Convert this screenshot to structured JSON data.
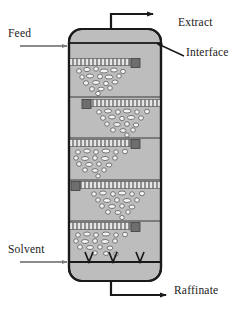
{
  "diagram": {
    "labels": {
      "feed": "Feed",
      "extract": "Extract",
      "interface": "Interface",
      "solvent": "Solvent",
      "raffinate": "Raffinate"
    },
    "colors": {
      "vessel_fill": "#bdbdbd",
      "vessel_outline": "#1a1a1a",
      "tray_stripe_dark": "#8a8a8a",
      "tray_stripe_light": "#e8e8e8",
      "downcomer": "#6e6e6e",
      "droplet_fill": "#f2f2f2",
      "droplet_stroke": "#555555",
      "pipe_gray": "#8c8c8c",
      "text": "#1a1a1a"
    },
    "vessel": {
      "left": 69,
      "right": 161,
      "top": 29,
      "bottom": 281,
      "corner_radius": 13
    },
    "interface_line_y": 43,
    "nozzle_marks": {
      "count": 3,
      "glyph": "V",
      "baseline_y": 262,
      "x_positions": [
        89,
        113,
        140
      ]
    },
    "trays": [
      {
        "stage": 1,
        "y": 59,
        "x_start": 71,
        "x_end": 131,
        "downcomer_side": "right"
      },
      {
        "stage": 2,
        "y": 100,
        "x_start": 91,
        "x_end": 159,
        "downcomer_side": "left"
      },
      {
        "stage": 3,
        "y": 140,
        "x_start": 71,
        "x_end": 131,
        "downcomer_side": "right"
      },
      {
        "stage": 4,
        "y": 182,
        "x_start": 71,
        "x_end": 159,
        "downcomer_side": "left"
      },
      {
        "stage": 5,
        "y": 223,
        "x_start": 71,
        "x_end": 131,
        "downcomer_side": "right"
      }
    ],
    "stage_dividers_y": [
      97,
      138,
      180,
      221
    ],
    "streams": [
      {
        "name": "feed",
        "type": "inlet",
        "y": 46,
        "from_x": 20,
        "to_x": 69
      },
      {
        "name": "extract",
        "type": "outlet",
        "top_y": 14,
        "stem_x": 111,
        "arrow_to_x": 155
      },
      {
        "name": "solvent",
        "type": "inlet",
        "y": 262,
        "from_x": 20,
        "to_x": 69
      },
      {
        "name": "raffinate",
        "type": "outlet",
        "bottom_y": 295,
        "stem_x": 111,
        "arrow_to_x": 168
      }
    ]
  }
}
